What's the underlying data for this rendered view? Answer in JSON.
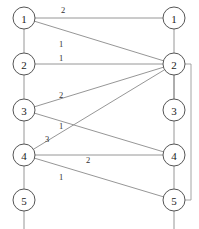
{
  "diagram": {
    "type": "bipartite-graph",
    "title": "",
    "left_column": {
      "name": "left-nodes",
      "nodes": [
        {
          "id": "L1",
          "label": "1",
          "x": 24,
          "y": 18
        },
        {
          "id": "L2",
          "label": "2",
          "x": 24,
          "y": 64
        },
        {
          "id": "L3",
          "label": "3",
          "x": 24,
          "y": 110
        },
        {
          "id": "L4",
          "label": "4",
          "x": 24,
          "y": 155
        },
        {
          "id": "L5",
          "label": "5",
          "x": 24,
          "y": 200
        }
      ]
    },
    "right_column": {
      "name": "right-nodes",
      "nodes": [
        {
          "id": "R1",
          "label": "1",
          "x": 174,
          "y": 18
        },
        {
          "id": "R2",
          "label": "2",
          "x": 174,
          "y": 64
        },
        {
          "id": "R3",
          "label": "3",
          "x": 174,
          "y": 110
        },
        {
          "id": "R4",
          "label": "4",
          "x": 174,
          "y": 155
        },
        {
          "id": "R5",
          "label": "5",
          "x": 174,
          "y": 200
        }
      ]
    },
    "node_radius": 11,
    "edges": [
      {
        "id": "e-L1-R1",
        "from": "L1",
        "to": "R1",
        "label": "2",
        "label_x": 63,
        "label_y": 10
      },
      {
        "id": "e-L1-R2",
        "from": "L1",
        "to": "R2",
        "label": "1",
        "label_x": 61,
        "label_y": 44
      },
      {
        "id": "e-L2-R2",
        "from": "L2",
        "to": "R2",
        "label": "1",
        "label_x": 61,
        "label_y": 58
      },
      {
        "id": "e-L3-R2",
        "from": "L3",
        "to": "R2",
        "label": "2",
        "label_x": 61,
        "label_y": 95
      },
      {
        "id": "e-L3-R4",
        "from": "L3",
        "to": "R4",
        "label": "1",
        "label_x": 61,
        "label_y": 126
      },
      {
        "id": "e-L4-R2",
        "from": "L4",
        "to": "R2",
        "label": "3",
        "label_x": 47,
        "label_y": 139
      },
      {
        "id": "e-L4-R4",
        "from": "L4",
        "to": "R4",
        "label": "2",
        "label_x": 88,
        "label_y": 160
      },
      {
        "id": "e-L4-R5",
        "from": "L4",
        "to": "R5",
        "label": "1",
        "label_x": 61,
        "label_y": 177
      },
      {
        "id": "e-R2-R3",
        "from": "R2",
        "to": "R3",
        "label": "",
        "label_x": 0,
        "label_y": 0
      }
    ],
    "vertical_spines": [
      {
        "id": "spine-left",
        "x": 24,
        "y1": 18,
        "y2": 229
      },
      {
        "id": "spine-right",
        "x": 174,
        "y1": 18,
        "y2": 229
      }
    ],
    "bracket": {
      "id": "right-bracket",
      "x": 191,
      "y_top": 64,
      "y_bottom": 200,
      "node_x": 174
    },
    "colors": {
      "node_stroke": "#555555",
      "node_fill": "#ffffff",
      "edge_stroke": "#8a8a8a",
      "text": "#222222",
      "background": "#ffffff"
    }
  }
}
